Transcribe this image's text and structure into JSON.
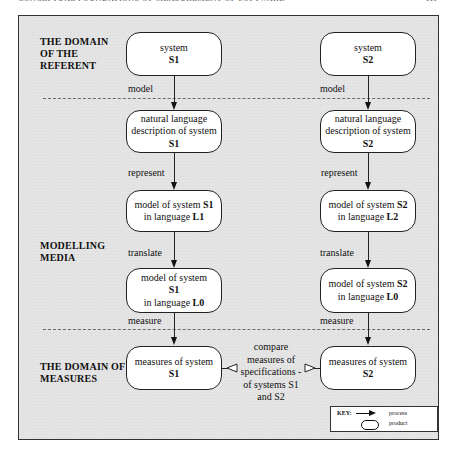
{
  "page": {
    "running_header": "CONCEPTUAL FOUNDATIONS OF MEASUREMENT OF SOFTWARE",
    "page_number": "111"
  },
  "sections": {
    "referent": "THE DOMAIN\nOF THE\nREFERENT",
    "media": "MODELLING\nMEDIA",
    "measures": "THE DOMAIN OF\nMEASURES"
  },
  "left_column": {
    "system": {
      "line1": "system",
      "bold": "S1"
    },
    "description": {
      "line1": "natural language",
      "line2": "description of system",
      "bold": "S1"
    },
    "model_native": {
      "line1_pre": "model of system ",
      "line1_bold": "S1",
      "line2_pre": "in language ",
      "line2_bold": "L1"
    },
    "model_l0": {
      "line1": "model of system",
      "bold": "S1",
      "line3_pre": "in language ",
      "line3_bold": "L0"
    },
    "measures": {
      "line1": "measures of system",
      "bold": "S1"
    }
  },
  "right_column": {
    "system": {
      "line1": "system",
      "bold": "S2"
    },
    "description": {
      "line1": "natural language",
      "line2": "description of system",
      "bold": "S2"
    },
    "model_native": {
      "line1_pre": "model of system ",
      "line1_bold": "S2",
      "line2_pre": "in language ",
      "line2_bold": "L2"
    },
    "model_l0": {
      "line1_pre": "model of system ",
      "line1_bold": "S2",
      "line2_pre": "in language ",
      "line2_bold": "L0"
    },
    "measures": {
      "line1": "measures of system",
      "bold": "S2"
    }
  },
  "edges": {
    "model": "model",
    "represent": "represent",
    "translate": "translate",
    "measure": "measure"
  },
  "compare": "compare\nmeasures of\nspecifications -\nof systems S1\nand S2",
  "key": {
    "label": "KEY:",
    "process": "process",
    "product": "product"
  }
}
